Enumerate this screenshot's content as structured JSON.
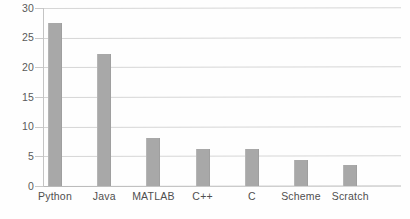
{
  "chart_data": {
    "type": "bar",
    "title": "",
    "subtitle": "",
    "xlabel": "",
    "ylabel": "",
    "categories": [
      "Python",
      "Java",
      "MATLAB",
      "C++",
      "C",
      "Scheme",
      "Scratch"
    ],
    "values": [
      27.5,
      22.2,
      8.1,
      6.3,
      6.3,
      4.4,
      3.5
    ],
    "ylim": [
      0,
      30
    ],
    "yticks": [
      0,
      5,
      10,
      15,
      20,
      25,
      30
    ],
    "ytick_labels": [
      "0",
      "5",
      "10",
      "15",
      "20",
      "25",
      "30"
    ],
    "grid": true,
    "grid_axis": "y",
    "legend": null,
    "legend_position": "none",
    "annotations": [],
    "colors": {
      "bar": "#a8a8a8",
      "gridline": "#d6d6d6",
      "axis": "#c4c4c4",
      "baseline": "#b9b9b9",
      "tick_text": "#5a5a5a",
      "category_text": "#4f4f4f",
      "background": "#fefefe"
    }
  }
}
